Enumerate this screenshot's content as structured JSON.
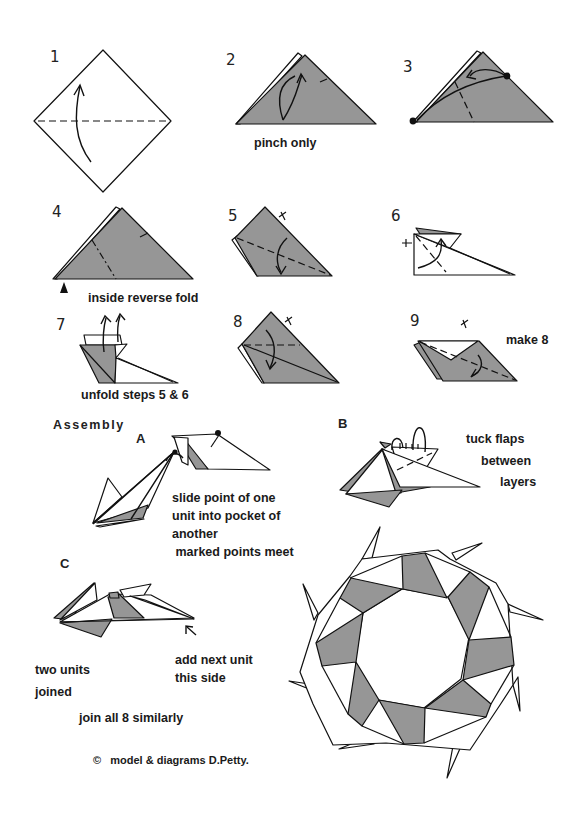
{
  "diagram": {
    "colors": {
      "paper_shaded": "#969696",
      "paper_white": "#ffffff",
      "line": "#111111",
      "background": "#ffffff"
    },
    "steps": [
      {
        "number": "1",
        "caption": ""
      },
      {
        "number": "2",
        "caption": "pinch only"
      },
      {
        "number": "3",
        "caption": ""
      },
      {
        "number": "4",
        "caption": "inside reverse fold"
      },
      {
        "number": "5",
        "caption": ""
      },
      {
        "number": "6",
        "caption": ""
      },
      {
        "number": "7",
        "caption": "unfold steps 5 & 6"
      },
      {
        "number": "8",
        "caption": ""
      },
      {
        "number": "9",
        "caption": "make 8"
      }
    ],
    "assembly": {
      "heading": "Assembly",
      "A": {
        "label": "A",
        "text_lines": [
          "slide point of one",
          "unit into pocket of",
          "another",
          " marked points meet"
        ]
      },
      "B": {
        "label": "B",
        "text_lines": [
          "tuck flaps",
          "between",
          "layers"
        ]
      },
      "C": {
        "label": "C",
        "note_add": [
          "add next unit",
          "this side"
        ],
        "note_joined": [
          "two units",
          "joined"
        ],
        "note_all": "join all 8 similarly"
      }
    },
    "copyright": "©   model & diagrams D.Petty."
  }
}
